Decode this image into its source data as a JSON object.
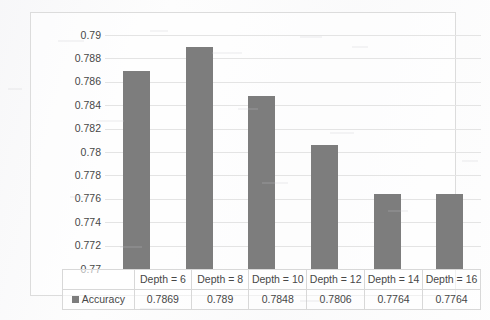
{
  "chart_data": {
    "type": "bar",
    "title": "",
    "xlabel": "",
    "ylabel": "",
    "categories": [
      "Depth = 6",
      "Depth = 8",
      "Depth = 10",
      "Depth = 12",
      "Depth = 14",
      "Depth = 16"
    ],
    "values": [
      0.7869,
      0.789,
      0.7848,
      0.7806,
      0.7764,
      0.7764
    ],
    "value_labels": [
      "0.7869",
      "0.789",
      "0.7848",
      "0.7806",
      "0.7764",
      "0.7764"
    ],
    "series": [
      {
        "name": "Accuracy",
        "values": [
          0.7869,
          0.789,
          0.7848,
          0.7806,
          0.7764,
          0.7764
        ]
      }
    ],
    "ylim": [
      0.77,
      0.79
    ],
    "ytick_labels": [
      "0.79",
      "0.788",
      "0.786",
      "0.784",
      "0.782",
      "0.78",
      "0.778",
      "0.776",
      "0.774",
      "0.772",
      "0.77"
    ],
    "ytick_values": [
      0.79,
      0.788,
      0.786,
      0.784,
      0.782,
      0.78,
      0.778,
      0.776,
      0.774,
      0.772,
      0.77
    ],
    "grid": true,
    "legend_position": "data-table",
    "has_data_table": true,
    "bar_color": "#7d7d7d",
    "gridline_color": "#e4e4e4"
  },
  "legend": {
    "series_label": "Accuracy",
    "swatch_color": "#7d7d7d"
  },
  "table": {
    "row_label": "Accuracy",
    "headers": [
      "Depth = 6",
      "Depth = 8",
      "Depth = 10",
      "Depth = 12",
      "Depth = 14",
      "Depth = 16"
    ],
    "values": [
      "0.7869",
      "0.789",
      "0.7848",
      "0.7806",
      "0.7764",
      "0.7764"
    ]
  }
}
